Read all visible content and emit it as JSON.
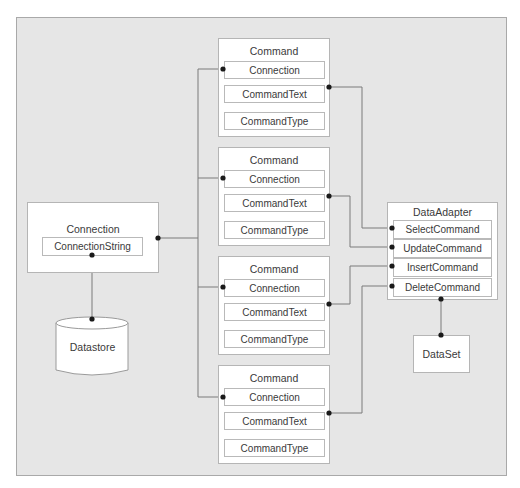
{
  "diagram": {
    "connection": {
      "title": "Connection",
      "property": "ConnectionString"
    },
    "datastore": {
      "label": "Datastore"
    },
    "commands": [
      {
        "title": "Command",
        "properties": [
          "Connection",
          "CommandText",
          "CommandType"
        ]
      },
      {
        "title": "Command",
        "properties": [
          "Connection",
          "CommandText",
          "CommandType"
        ]
      },
      {
        "title": "Command",
        "properties": [
          "Connection",
          "CommandText",
          "CommandType"
        ]
      },
      {
        "title": "Command",
        "properties": [
          "Connection",
          "CommandText",
          "CommandType"
        ]
      }
    ],
    "data_adapter": {
      "title": "DataAdapter",
      "properties": [
        "SelectCommand",
        "UpdateCommand",
        "InsertCommand",
        "DeleteCommand"
      ]
    },
    "dataset": {
      "label": "DataSet"
    },
    "edges": [
      {
        "from": "Connection.ConnectionString",
        "to": "Datastore"
      },
      {
        "from": "Connection",
        "to": "Command[0].Connection"
      },
      {
        "from": "Connection",
        "to": "Command[1].Connection"
      },
      {
        "from": "Connection",
        "to": "Command[2].Connection"
      },
      {
        "from": "Connection",
        "to": "Command[3].Connection"
      },
      {
        "from": "Command[0].CommandText",
        "to": "DataAdapter.SelectCommand"
      },
      {
        "from": "Command[1].CommandText",
        "to": "DataAdapter.UpdateCommand"
      },
      {
        "from": "Command[2].CommandText",
        "to": "DataAdapter.InsertCommand"
      },
      {
        "from": "Command[3].CommandText",
        "to": "DataAdapter.DeleteCommand"
      },
      {
        "from": "DataAdapter",
        "to": "DataSet"
      }
    ],
    "colors": {
      "background": "#e6e6e6",
      "box_fill": "#ffffff",
      "border": "#b5b5b5",
      "line": "#7a7a7a",
      "dot": "#1a1a1a"
    }
  }
}
